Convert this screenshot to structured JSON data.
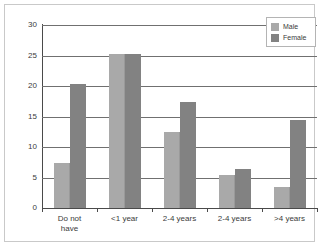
{
  "chart_data": {
    "type": "bar",
    "title": "",
    "subtitle": "",
    "xlabel": "",
    "ylabel": "",
    "ylim": [
      0,
      30
    ],
    "yticks": [
      0,
      5,
      10,
      15,
      20,
      25,
      30
    ],
    "ytick_labels": [
      "0",
      "5",
      "10",
      "15",
      "20",
      "25",
      "30"
    ],
    "grid": true,
    "grid_axis": "y",
    "legend_position": "top-right",
    "categories": [
      "Do not have",
      "<1 year",
      "2-4 years",
      "2-4 years",
      ">4 years"
    ],
    "category_lines": [
      [
        "Do not",
        "have"
      ],
      [
        "<1 year"
      ],
      [
        "2-4 years"
      ],
      [
        "2-4 years"
      ],
      [
        ">4 years"
      ]
    ],
    "series": [
      {
        "name": "Male",
        "color": "#a9a9a9",
        "values": [
          7.4,
          25.3,
          12.4,
          5.4,
          3.5
        ]
      },
      {
        "name": "Female",
        "color": "#828282",
        "values": [
          20.3,
          25.3,
          17.3,
          6.4,
          14.5
        ]
      }
    ]
  },
  "legend": {
    "entries": [
      {
        "label": "Male"
      },
      {
        "label": "Female"
      }
    ]
  }
}
